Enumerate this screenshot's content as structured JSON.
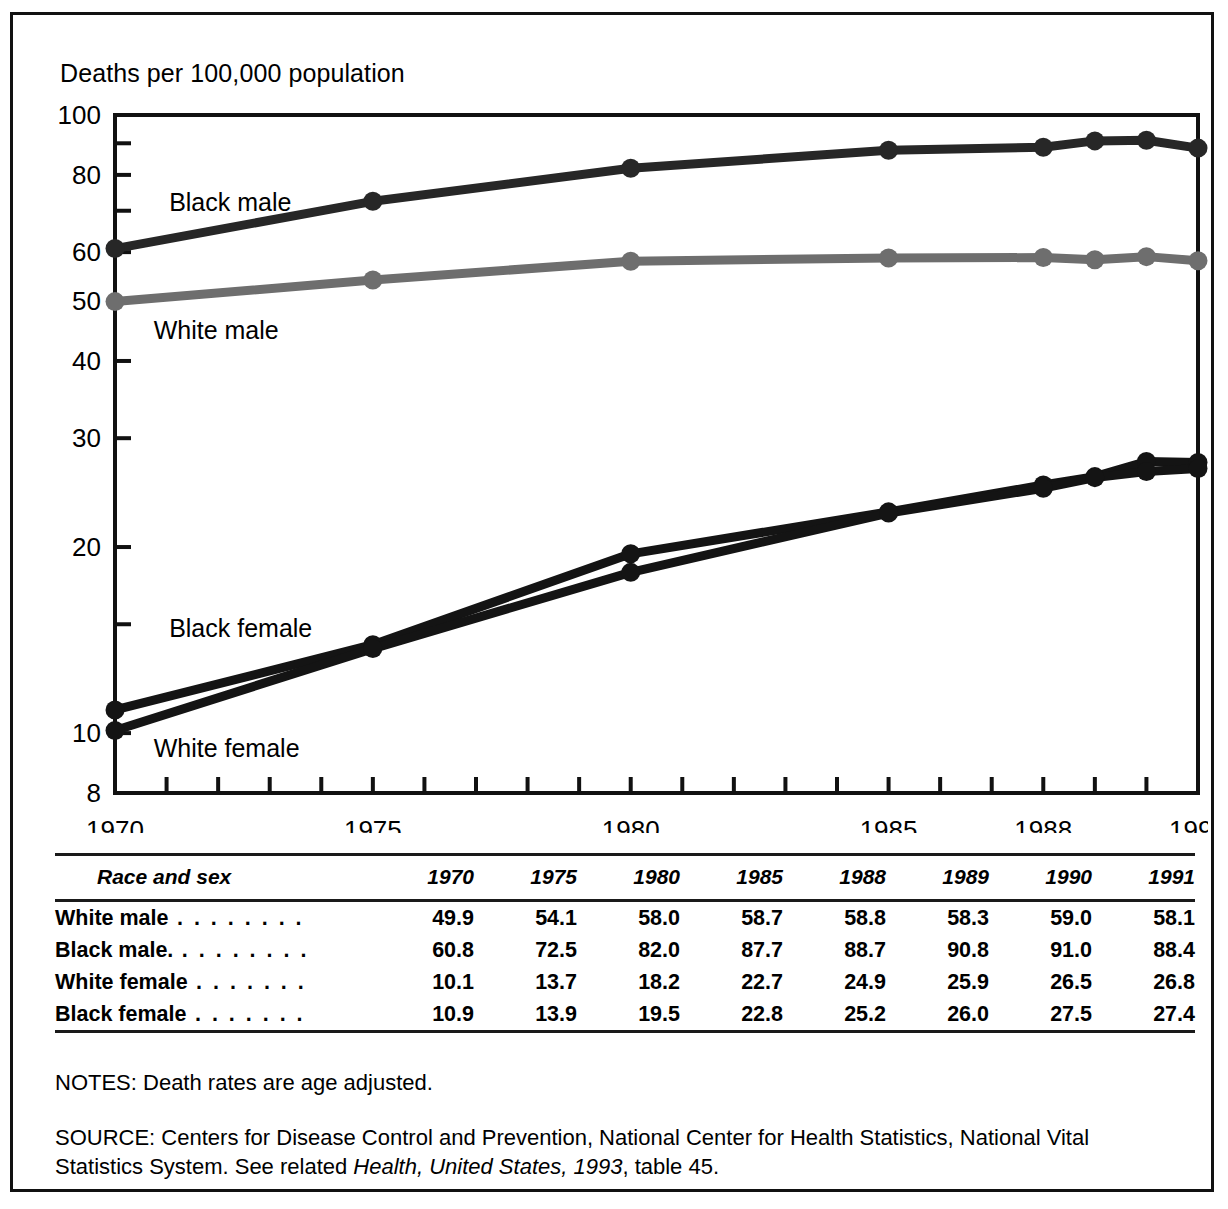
{
  "figure": {
    "y_axis_title": "Deaths per 100,000 population",
    "notes": "NOTES: Death rates are age adjusted.",
    "source_prefix": "SOURCE: Centers for Disease Control and Prevention, National Center for Health Statistics, National Vital Statistics System. See related ",
    "source_italic": "Health, United States, 1993",
    "source_suffix": ", table 45."
  },
  "chart_data": {
    "type": "line",
    "title": "",
    "xlabel": "",
    "ylabel": "Deaths per 100,000 population",
    "yscale": "log",
    "ylim": [
      8,
      100
    ],
    "xlim": [
      1970,
      1991
    ],
    "grid": false,
    "legend": "inline-labels",
    "ytick_labels": [
      "100",
      "80",
      "60",
      "50",
      "40",
      "30",
      "20",
      "10",
      "8"
    ],
    "ytick_values": [
      100,
      80,
      60,
      50,
      40,
      30,
      20,
      10,
      8
    ],
    "xtick_labels": [
      "1970",
      "1975",
      "1980",
      "1985",
      "1988",
      "1991"
    ],
    "xtick_values": [
      1970,
      1975,
      1980,
      1985,
      1988,
      1991
    ],
    "x": [
      1970,
      1975,
      1980,
      1985,
      1988,
      1989,
      1990,
      1991
    ],
    "series": [
      {
        "name": "Black male",
        "color": "#272727",
        "label_x": 1971.05,
        "label_y": 70.0,
        "values": [
          60.8,
          72.5,
          82.0,
          87.7,
          88.7,
          90.8,
          91.0,
          88.4
        ]
      },
      {
        "name": "White male",
        "color": "#6e6e6e",
        "label_x": 1970.75,
        "label_y": 43.4,
        "values": [
          49.9,
          54.1,
          58.0,
          58.7,
          58.8,
          58.3,
          59.0,
          58.1
        ]
      },
      {
        "name": "Black female",
        "color": "#141414",
        "label_x": 1971.05,
        "label_y": 14.3,
        "values": [
          10.9,
          13.9,
          19.5,
          22.8,
          25.2,
          26.0,
          27.5,
          27.4
        ]
      },
      {
        "name": "White female",
        "color": "#141414",
        "label_x": 1970.75,
        "label_y": 9.15,
        "values": [
          10.1,
          13.7,
          18.2,
          22.7,
          24.9,
          25.9,
          26.5,
          26.8
        ]
      }
    ]
  },
  "table": {
    "headers": [
      "Race and sex",
      "1970",
      "1975",
      "1980",
      "1985",
      "1988",
      "1989",
      "1990",
      "1991"
    ],
    "rows": [
      {
        "label": "White male",
        "leader": ". . . . . . . .",
        "values": [
          "49.9",
          "54.1",
          "58.0",
          "58.7",
          "58.8",
          "58.3",
          "59.0",
          "58.1"
        ]
      },
      {
        "label": "Black male.",
        "leader": ". . . . . . . .",
        "values": [
          "60.8",
          "72.5",
          "82.0",
          "87.7",
          "88.7",
          "90.8",
          "91.0",
          "88.4"
        ]
      },
      {
        "label": "White female",
        "leader": ". . . . . . .",
        "values": [
          "10.1",
          "13.7",
          "18.2",
          "22.7",
          "24.9",
          "25.9",
          "26.5",
          "26.8"
        ]
      },
      {
        "label": "Black female",
        "leader": ". . . . . . .",
        "values": [
          "10.9",
          "13.9",
          "19.5",
          "22.8",
          "25.2",
          "26.0",
          "27.5",
          "27.4"
        ]
      }
    ]
  }
}
